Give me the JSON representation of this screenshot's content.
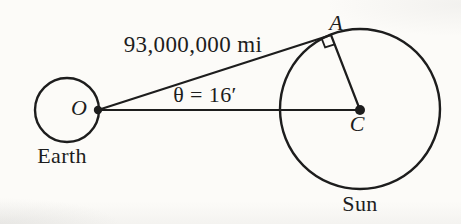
{
  "figure": {
    "labels": {
      "distance": "93,000,000 mi",
      "angle": "θ = 16′",
      "point_o": "O",
      "point_a": "A",
      "point_c": "C",
      "earth": "Earth",
      "sun": "Sun"
    },
    "colors": {
      "ink": "#1d1d1d",
      "background": "#fcfbf8"
    }
  }
}
